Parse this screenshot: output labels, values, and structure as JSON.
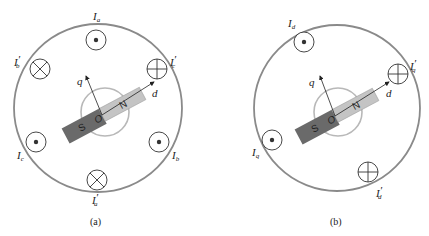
{
  "figures": [
    {
      "caption": "(a)",
      "axis_d": "d",
      "axis_q": "q",
      "origin": "O",
      "pole_s": "S",
      "pole_n": "N",
      "conductors": [
        {
          "label": "I",
          "sub": "a",
          "prime": "",
          "type": "dot"
        },
        {
          "label": "I",
          "sub": "b",
          "prime": "′",
          "type": "cross"
        },
        {
          "label": "I",
          "sub": "c",
          "prime": "′",
          "type": "cross"
        },
        {
          "label": "I",
          "sub": "c",
          "prime": "",
          "type": "dot"
        },
        {
          "label": "I",
          "sub": "b",
          "prime": "",
          "type": "dot"
        },
        {
          "label": "I",
          "sub": "a",
          "prime": "′",
          "type": "cross"
        }
      ]
    },
    {
      "caption": "(b)",
      "axis_d": "d",
      "axis_q": "q",
      "origin": "O",
      "pole_s": "S",
      "pole_n": "N",
      "conductors": [
        {
          "label": "I",
          "sub": "d",
          "prime": "",
          "type": "dot"
        },
        {
          "label": "I",
          "sub": "q",
          "prime": "′",
          "type": "cross"
        },
        {
          "label": "I",
          "sub": "q",
          "prime": "",
          "type": "dot"
        },
        {
          "label": "I",
          "sub": "d",
          "prime": "′",
          "type": "cross"
        }
      ]
    }
  ],
  "colors": {
    "stator": "#8a8a8a",
    "rotor_circle": "#b8b8b8",
    "south_pole": "#6a6a6a",
    "north_pole": "#c4c4c4",
    "conductor": "#333333"
  }
}
